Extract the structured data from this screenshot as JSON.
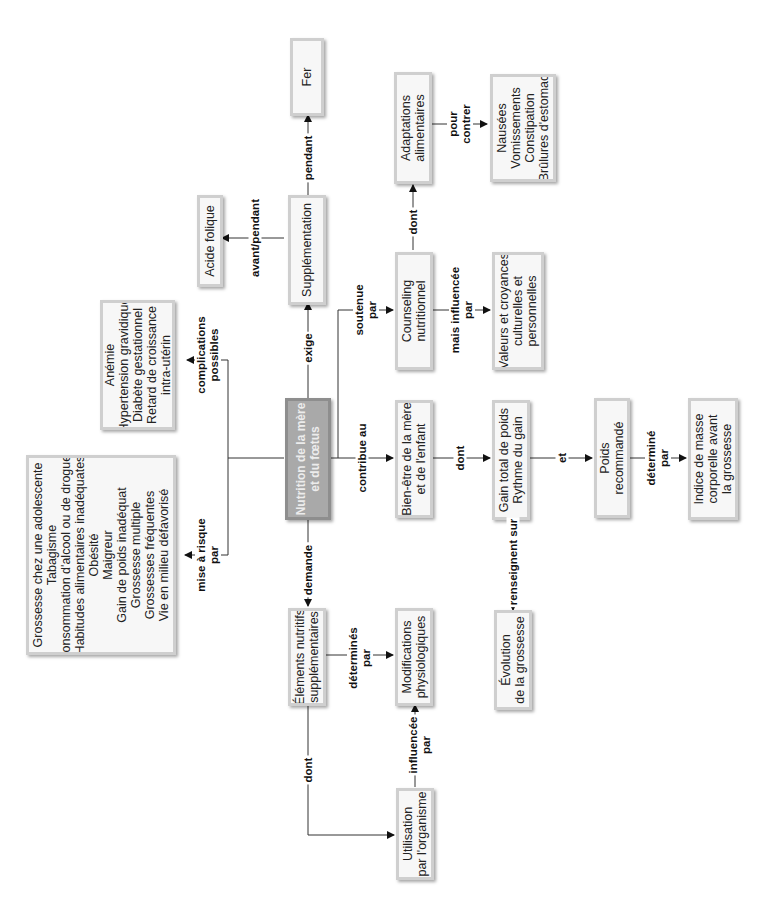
{
  "diagram": {
    "title": "Nutrition de la mère et du fœtus",
    "nodes": {
      "central": {
        "lines": [
          "Nutrition de la mère",
          "et du fœtus"
        ]
      },
      "supplementation": {
        "lines": [
          "Supplémentation"
        ]
      },
      "acide_folique": {
        "lines": [
          "Acide folique"
        ]
      },
      "fer": {
        "lines": [
          "Fer"
        ]
      },
      "complications": {
        "lines": [
          "Anémie",
          "Hypertension gravidique",
          "Diabète gestationnel",
          "Retard de croissance",
          "intra-utérin"
        ]
      },
      "facteurs_risque": {
        "lines": [
          "Grossesse chez une adolescente",
          "Tabagisme",
          "Consommation d'alcool ou de drogues",
          "Habitudes alimentaires inadéquates",
          "Obésité",
          "Maigreur",
          "Gain de poids inadéquat",
          "Grossesse multiple",
          "Grossesses fréquentes",
          "Vie en milieu défavorisé"
        ]
      },
      "counseling": {
        "lines": [
          "Counseling",
          "nutritionnel"
        ]
      },
      "adaptations": {
        "lines": [
          "Adaptations",
          "alimentaires"
        ]
      },
      "symptomes": {
        "lines": [
          "Nausées",
          "Vomissements",
          "Constipation",
          "Brûlures d'estomac"
        ]
      },
      "valeurs": {
        "lines": [
          "Valeurs et croyances",
          "culturelles et",
          "personnelles"
        ]
      },
      "bien_etre": {
        "lines": [
          "Bien-être de la mère",
          "et de l'enfant"
        ]
      },
      "gain_poids": {
        "lines": [
          "Gain total de poids",
          "Rythme du gain"
        ]
      },
      "poids_recommande": {
        "lines": [
          "Poids",
          "recommandé"
        ]
      },
      "imc": {
        "lines": [
          "Indice de masse",
          "corporelle avant",
          "la grossesse"
        ]
      },
      "evolution": {
        "lines": [
          "Évolution",
          "de la grossesse"
        ]
      },
      "elements_nutritifs": {
        "lines": [
          "Éléments nutritifs",
          "supplémentaires"
        ]
      },
      "modifications": {
        "lines": [
          "Modifications",
          "physiologiques"
        ]
      },
      "utilisation": {
        "lines": [
          "Utilisation",
          "par l'organisme"
        ]
      }
    },
    "edges": {
      "exige": [
        "exige"
      ],
      "avant_pendant": [
        "avant/pendant"
      ],
      "pendant": [
        "pendant"
      ],
      "complications_possibles": [
        "complications",
        "possibles"
      ],
      "mise_a_risque": [
        "mise à risque",
        "par"
      ],
      "soutenue_par": [
        "soutenue",
        "par"
      ],
      "dont_adapt": [
        "dont"
      ],
      "pour_contrer": [
        "pour",
        "contrer"
      ],
      "mais_influencee": [
        "mais influencée",
        "par"
      ],
      "contribue_au": [
        "contribue au"
      ],
      "dont_gain": [
        "dont"
      ],
      "et": [
        "et"
      ],
      "determine_par": [
        "déterminé",
        "par"
      ],
      "renseignent_sur": [
        "renseignent sur"
      ],
      "demande": [
        "demande"
      ],
      "determines_par": [
        "déterminés",
        "par"
      ],
      "dont_util": [
        "dont"
      ],
      "influencee_par": [
        "influencée",
        "par"
      ]
    }
  }
}
